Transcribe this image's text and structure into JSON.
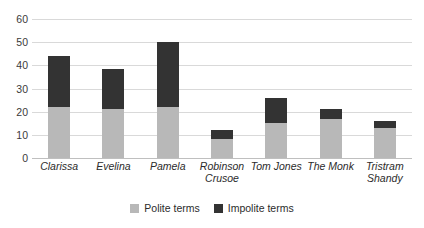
{
  "chart_data": {
    "type": "bar",
    "subtype": "stacked-vertical",
    "title": "",
    "subtitle": "",
    "xlabel": "",
    "ylabel": "",
    "ylim": [
      0,
      60
    ],
    "yticks": [
      0,
      10,
      20,
      30,
      40,
      50,
      60
    ],
    "grid": true,
    "legend_position": "bottom-center",
    "categories": [
      "Clarissa",
      "Evelina",
      "Pamela",
      "Robinson Crusoe",
      "Tom Jones",
      "The Monk",
      "Tristram Shandy"
    ],
    "category_lines": [
      [
        "Clarissa"
      ],
      [
        "Evelina"
      ],
      [
        "Pamela"
      ],
      [
        "Robinson",
        "Crusoe"
      ],
      [
        "Tom Jones"
      ],
      [
        "The Monk"
      ],
      [
        "Tristram",
        "Shandy"
      ]
    ],
    "series": [
      {
        "name": "Polite terms",
        "color": "#b8b8b8",
        "values": [
          22,
          21,
          22,
          8,
          15,
          17,
          13
        ]
      },
      {
        "name": "Impolite terms",
        "color": "#333333",
        "values": [
          22,
          17.5,
          28,
          4,
          11,
          4,
          3
        ]
      }
    ],
    "totals": [
      44,
      38.5,
      50,
      12,
      26,
      21,
      16
    ]
  },
  "legend": {
    "items": [
      {
        "label": "Polite terms",
        "color": "#b8b8b8"
      },
      {
        "label": "Impolite terms",
        "color": "#333333"
      }
    ]
  },
  "yticks_text": [
    "0",
    "10",
    "20",
    "30",
    "40",
    "50",
    "60"
  ]
}
